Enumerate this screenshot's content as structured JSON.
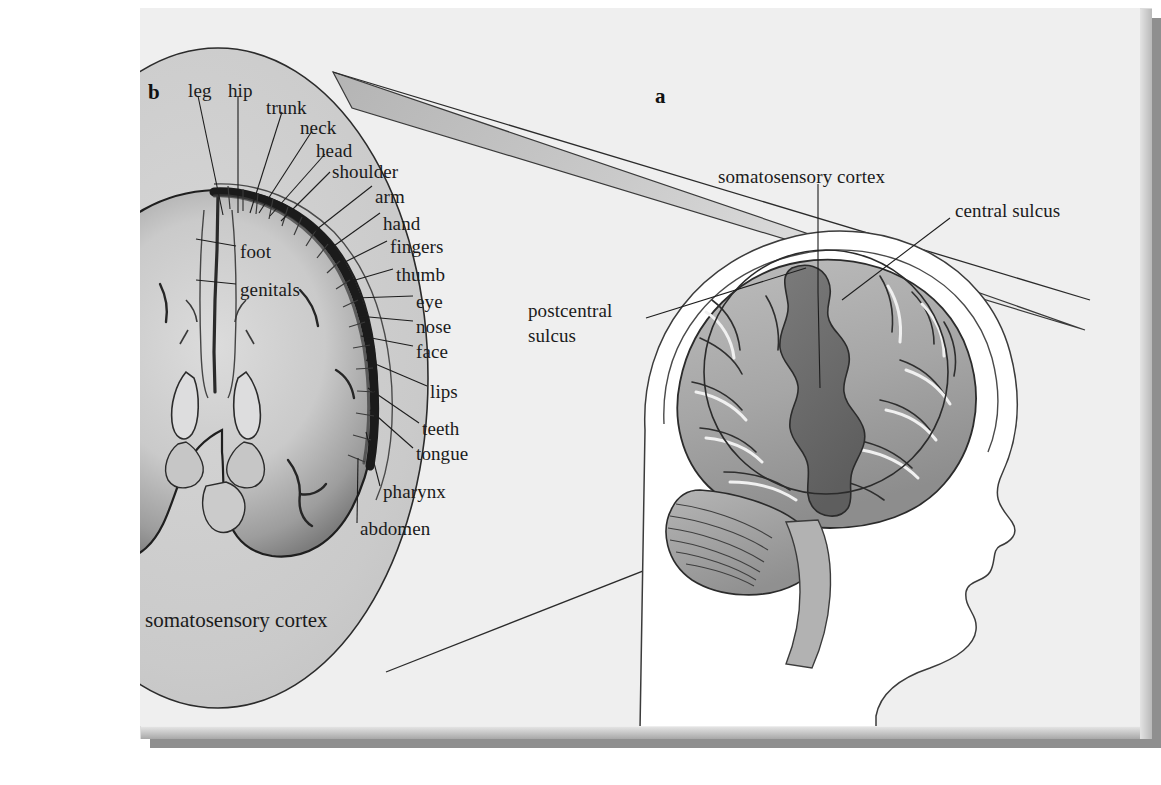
{
  "figure": {
    "title_caption": "somatosensory cortex",
    "panels": [
      {
        "id": "a",
        "letter": "a"
      },
      {
        "id": "b",
        "letter": "b"
      }
    ]
  },
  "colors": {
    "page_background": "#ffffff",
    "frame_face": "#ededed",
    "frame_shadow": "#8f8f8f",
    "canvas_background": "#efefef",
    "ellipse_fill": "#cfcfcf",
    "cortex_gray_matter": "#a9a9a9",
    "cortex_inner": "#d2d2d2",
    "brain_fill": "#a8a8a8",
    "somatosensory_highlight": "#6e6e6e",
    "leader_line": "#222222",
    "label_text": "#1b1b1b",
    "wedge_gradient_dark": "#9a9a9a",
    "wedge_gradient_light": "#e6e6e6"
  },
  "panel_a": {
    "letter": "a",
    "labels": [
      {
        "name": "somatosensory-cortex",
        "text": "somatosensory cortex",
        "x": 718,
        "y": 168
      },
      {
        "name": "central-sulcus",
        "text": "central sulcus",
        "x": 955,
        "y": 202
      },
      {
        "name": "postcentral-sulcus-line1",
        "text": "postcentral",
        "x": 530,
        "y": 309
      },
      {
        "name": "postcentral-sulcus-line2",
        "text": "sulcus",
        "x": 530,
        "y": 334
      }
    ],
    "structures": [
      "head-profile",
      "skull-outline",
      "cerebrum",
      "cerebellum",
      "brainstem",
      "magnifier-circle",
      "somatosensory-strip"
    ]
  },
  "panel_b": {
    "letter": "b",
    "caption": "somatosensory cortex",
    "caption_x": 145,
    "caption_y": 610,
    "view": "coronal section of cerebral hemispheres",
    "homunculus_labels_left": [
      {
        "name": "leg",
        "text": "leg",
        "x": 191,
        "y": 83,
        "tip_x": 223,
        "tip_y": 215
      },
      {
        "name": "hip",
        "text": "hip",
        "x": 231,
        "y": 83,
        "tip_x": 238,
        "tip_y": 213
      },
      {
        "name": "trunk",
        "text": "trunk",
        "x": 268,
        "y": 99,
        "tip_x": 250,
        "tip_y": 213
      },
      {
        "name": "neck",
        "text": "neck",
        "x": 302,
        "y": 118,
        "tip_x": 259,
        "tip_y": 213
      },
      {
        "name": "head",
        "text": "head",
        "x": 318,
        "y": 141,
        "tip_x": 270,
        "tip_y": 216
      },
      {
        "name": "shoulder",
        "text": "shoulder",
        "x": 334,
        "y": 163,
        "tip_x": 281,
        "tip_y": 221
      },
      {
        "name": "arm",
        "text": "arm",
        "x": 377,
        "y": 188,
        "tip_x": 312,
        "tip_y": 233
      },
      {
        "name": "hand",
        "text": "hand",
        "x": 385,
        "y": 215,
        "tip_x": 331,
        "tip_y": 248
      },
      {
        "name": "foot",
        "text": "foot",
        "x": 240,
        "y": 248,
        "tip_x": 196,
        "tip_y": 239
      },
      {
        "name": "genitals",
        "text": "genitals",
        "x": 240,
        "y": 286,
        "tip_x": 196,
        "tip_y": 280
      }
    ],
    "homunculus_labels_right": [
      {
        "name": "fingers",
        "text": "fingers",
        "x": 392,
        "y": 243,
        "tip_x": 345,
        "tip_y": 262
      },
      {
        "name": "thumb",
        "text": "thumb",
        "x": 398,
        "y": 271,
        "tip_x": 352,
        "tip_y": 281
      },
      {
        "name": "eye",
        "text": "eye",
        "x": 418,
        "y": 298,
        "tip_x": 355,
        "tip_y": 298
      },
      {
        "name": "nose",
        "text": "nose",
        "x": 418,
        "y": 323,
        "tip_x": 358,
        "tip_y": 318
      },
      {
        "name": "face",
        "text": "face",
        "x": 418,
        "y": 348,
        "tip_x": 361,
        "tip_y": 339
      },
      {
        "name": "lips",
        "text": "lips",
        "x": 432,
        "y": 388,
        "tip_x": 366,
        "tip_y": 368
      },
      {
        "name": "teeth",
        "text": "teeth",
        "x": 424,
        "y": 425,
        "tip_x": 368,
        "tip_y": 396
      },
      {
        "name": "tongue",
        "text": "tongue",
        "x": 418,
        "y": 450,
        "tip_x": 370,
        "tip_y": 418
      },
      {
        "name": "pharynx",
        "text": "pharynx",
        "x": 385,
        "y": 488,
        "tip_x": 366,
        "tip_y": 440
      },
      {
        "name": "abdomen",
        "text": "abdomen",
        "x": 362,
        "y": 525,
        "tip_x": 358,
        "tip_y": 466
      }
    ]
  }
}
